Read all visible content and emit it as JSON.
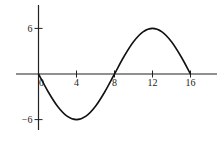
{
  "chart_data": {
    "type": "line",
    "title": "",
    "xlabel": "",
    "ylabel": "",
    "xlim": [
      -2,
      19
    ],
    "ylim": [
      -7,
      8
    ],
    "grid": false,
    "legend": "none",
    "x_ticks": [
      0,
      4,
      8,
      12,
      16
    ],
    "x_tick_labels": [
      "0",
      "4",
      "8",
      "12",
      "16"
    ],
    "y_ticks": [
      6,
      -6
    ],
    "y_tick_labels": [
      "6",
      "−6"
    ],
    "series": [
      {
        "name": "y = -6 sin(πx/8)",
        "x": [
          0,
          1,
          2,
          3,
          4,
          5,
          6,
          7,
          8,
          9,
          10,
          11,
          12,
          13,
          14,
          15,
          16
        ],
        "y": [
          0,
          -2.3,
          -4.24,
          -5.54,
          -6,
          -5.54,
          -4.24,
          -2.3,
          0,
          2.3,
          4.24,
          5.54,
          6,
          5.54,
          4.24,
          2.3,
          0
        ]
      }
    ]
  }
}
